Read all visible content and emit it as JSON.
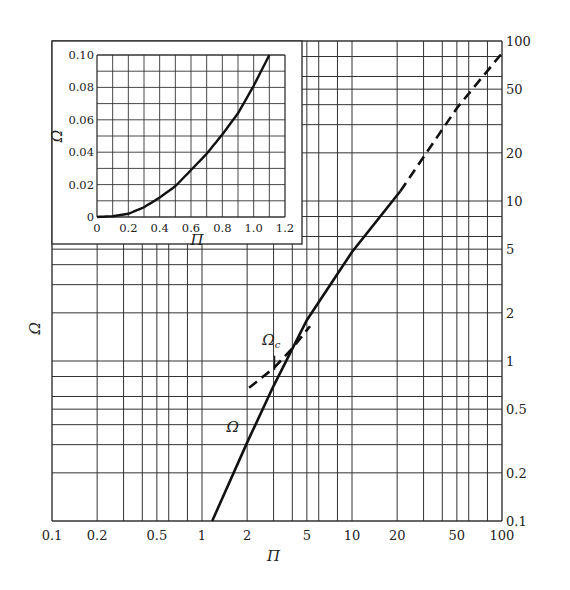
{
  "chart_data": [
    {
      "id": "main",
      "type": "line",
      "scale": {
        "x": "log",
        "y": "log"
      },
      "xlabel": "Π",
      "ylabel": "Ω",
      "xlim": [
        0.1,
        100
      ],
      "ylim": [
        0.1,
        100
      ],
      "x_ticks": [
        "0.1",
        "0.2",
        "0.5",
        "1",
        "2",
        "5",
        "10",
        "20",
        "50",
        "100"
      ],
      "y_ticks": [
        "0.1",
        "0.2",
        "0.5",
        "1",
        "2",
        "5",
        "10",
        "20",
        "50",
        "100"
      ],
      "y_axis_position": "right",
      "grid": true,
      "series": [
        {
          "name": "Ω",
          "style": "solid",
          "x": [
            1.17,
            2,
            3,
            5,
            10,
            21
          ],
          "y": [
            0.1,
            0.31,
            0.7,
            1.8,
            4.8,
            11.5
          ]
        },
        {
          "name": "Ω (extension)",
          "style": "dashed",
          "x": [
            21,
            50,
            100
          ],
          "y": [
            11.5,
            38,
            84
          ]
        },
        {
          "name": "Ωc",
          "style": "dashed",
          "x": [
            2.06,
            3,
            4,
            5.25
          ],
          "y": [
            0.68,
            0.9,
            1.2,
            1.65
          ]
        }
      ],
      "annotations": [
        {
          "text": "Ω",
          "x": 1.6,
          "y": 0.36
        },
        {
          "text": "Ωc",
          "x": 2.9,
          "y": 1.25
        }
      ]
    },
    {
      "id": "inset",
      "type": "line",
      "scale": {
        "x": "linear",
        "y": "linear"
      },
      "xlabel": "Π",
      "ylabel": "Ω",
      "xlim": [
        0,
        1.2
      ],
      "ylim": [
        0,
        0.1
      ],
      "x_ticks": [
        "0",
        "0.2",
        "0.4",
        "0.6",
        "0.8",
        "1.0",
        "1.2"
      ],
      "y_ticks": [
        "0",
        "0.02",
        "0.04",
        "0.06",
        "0.08",
        "0.10"
      ],
      "grid": true,
      "series": [
        {
          "name": "Ω",
          "style": "solid",
          "x": [
            0,
            0.1,
            0.2,
            0.3,
            0.4,
            0.5,
            0.6,
            0.7,
            0.8,
            0.9,
            1.0,
            1.1
          ],
          "y": [
            0,
            0.0005,
            0.002,
            0.006,
            0.012,
            0.019,
            0.029,
            0.039,
            0.051,
            0.064,
            0.081,
            0.1
          ]
        }
      ]
    }
  ]
}
